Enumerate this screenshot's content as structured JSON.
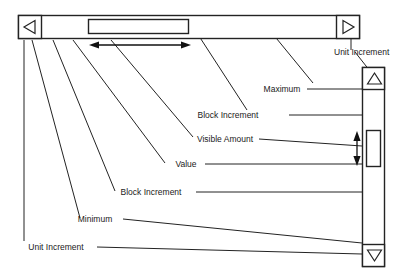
{
  "figure": {
    "background_color": "#ffffff",
    "line_color": "#232323",
    "text_color": "#1a1a1a"
  },
  "horizontal_scrollbar": {
    "name": "horizontal-scrollbar",
    "left_button_icon": "left-triangle-icon",
    "right_button_icon": "right-triangle-icon",
    "thumb_name": "horizontal-scrollbar-thumb",
    "track_name": "horizontal-scrollbar-track"
  },
  "vertical_scrollbar": {
    "name": "vertical-scrollbar",
    "up_button_icon": "up-triangle-icon",
    "down_button_icon": "down-triangle-icon",
    "thumb_name": "vertical-scrollbar-thumb",
    "track_name": "vertical-scrollbar-track"
  },
  "dimension_indicators": {
    "horizontal_visible_amount": "double-headed-horizontal-arrow",
    "vertical_visible_amount": "double-headed-vertical-arrow"
  },
  "callouts": [
    {
      "id": "unit-increment-top",
      "label": "Unit Increment"
    },
    {
      "id": "maximum",
      "label": "Maximum"
    },
    {
      "id": "block-increment-upper",
      "label": "Block Increment"
    },
    {
      "id": "visible-amount",
      "label": "Visible Amount"
    },
    {
      "id": "value",
      "label": "Value"
    },
    {
      "id": "block-increment-lower",
      "label": "Block Increment"
    },
    {
      "id": "minimum",
      "label": "Minimum"
    },
    {
      "id": "unit-increment-bottom",
      "label": "Unit Increment"
    }
  ]
}
